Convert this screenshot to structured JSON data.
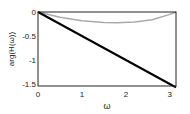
{
  "chart_data": {
    "type": "line",
    "title": "",
    "xlabel": "ω",
    "ylabel": "arg(H(ω))",
    "xlim": [
      0,
      3.1416
    ],
    "ylim": [
      -1.55,
      0
    ],
    "xticks": [
      "0",
      "1",
      "2",
      "3"
    ],
    "yticks": [
      "0",
      "-0.5",
      "-1",
      "-1.5"
    ],
    "grid": false,
    "series": [
      {
        "name": "linear phase",
        "color": "#000000",
        "x": [
          0,
          1,
          2,
          3,
          3.1416
        ],
        "y": [
          0,
          -0.5,
          -1.0,
          -1.5,
          -1.571
        ]
      },
      {
        "name": "phase deviation",
        "color": "#aaaaaa",
        "x": [
          0,
          0.5,
          1.0,
          1.5,
          1.8,
          2.2,
          2.6,
          3.0,
          3.1416
        ],
        "y": [
          0,
          -0.11,
          -0.18,
          -0.22,
          -0.225,
          -0.21,
          -0.16,
          -0.05,
          0
        ]
      }
    ]
  },
  "labels": {
    "x": "ω",
    "y": "arg(H(ω))"
  }
}
